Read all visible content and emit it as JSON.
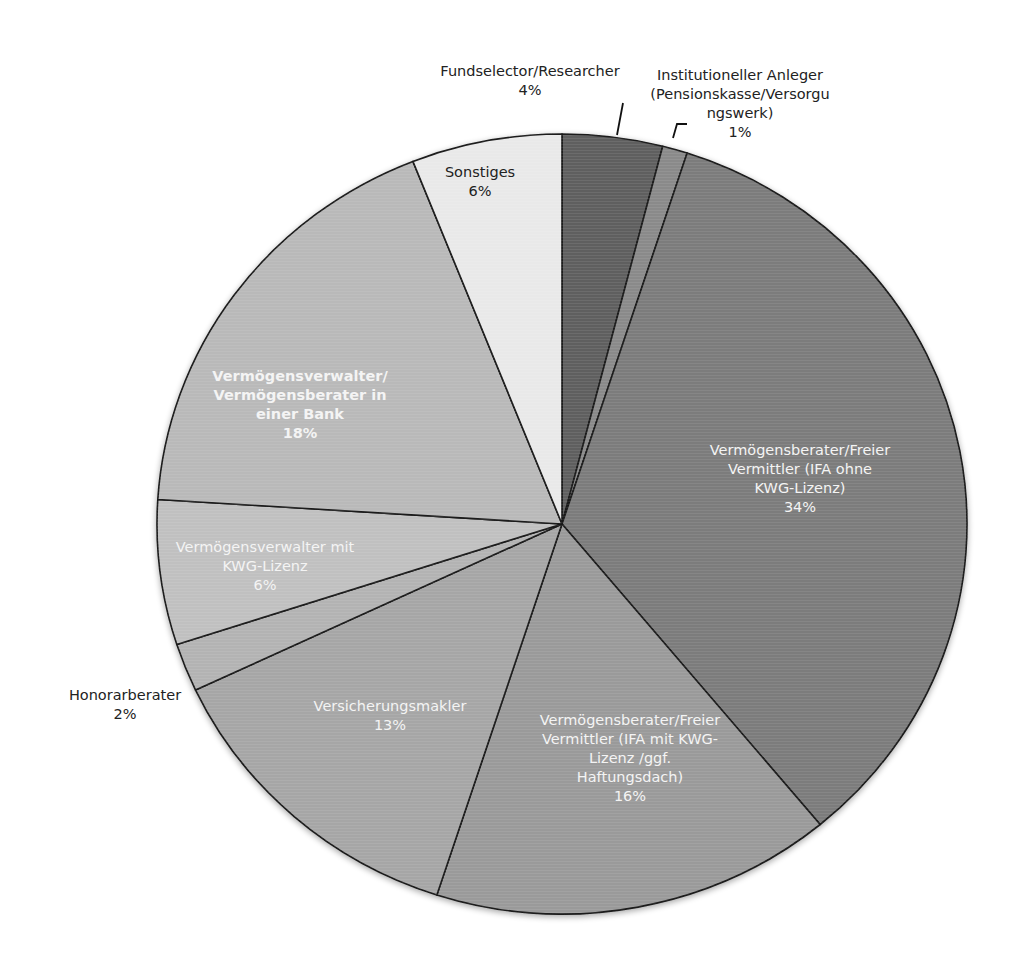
{
  "chart_data": {
    "type": "pie",
    "title": "",
    "start_angle": "12 o'clock, clockwise",
    "legend": "none (data labels on slices)",
    "slices": [
      {
        "label": "Fundselector/Researcher",
        "value": 4,
        "pct_label": "4%",
        "color": "#5e5e5e"
      },
      {
        "label": "Institutioneller Anleger (Pensionskasse/Versorgungswerk)",
        "value": 1,
        "pct_label": "1%",
        "color": "#8a8a8a"
      },
      {
        "label": "Vermögensberater/Freier Vermittler (IFA ohne KWG-Lizenz)",
        "value": 34,
        "pct_label": "34%",
        "color": "#7b7b7b"
      },
      {
        "label": "Vermögensberater/Freier Vermittler (IFA mit KWG-Lizenz /ggf. Haftungsdach)",
        "value": 16,
        "pct_label": "16%",
        "color": "#9a9a9a"
      },
      {
        "label": "Versicherungsmakler",
        "value": 13,
        "pct_label": "13%",
        "color": "#a6a6a6"
      },
      {
        "label": "Honorarberater",
        "value": 2,
        "pct_label": "2%",
        "color": "#b3b3b3"
      },
      {
        "label": "Vermögensverwalter mit KWG-Lizenz",
        "value": 6,
        "pct_label": "6%",
        "color": "#c0c0c0"
      },
      {
        "label": "Vermögensverwalter/ Vermögensberater in einer Bank",
        "value": 18,
        "pct_label": "18%",
        "color": "#b9b9b9"
      },
      {
        "label": "Sonstiges",
        "value": 6,
        "pct_label": "6%",
        "color": "#e9e9e9"
      }
    ]
  },
  "labels": {
    "fundselector": {
      "lines": [
        "Fundselector/Researcher"
      ],
      "pct": "4%"
    },
    "institutioneller": {
      "lines": [
        "Institutioneller Anleger",
        "(Pensionskasse/Versorgu",
        "ngswerk)"
      ],
      "pct": "1%"
    },
    "ifa_ohne": {
      "lines": [
        "Vermögensberater/Freier",
        "Vermittler (IFA ohne",
        "KWG-Lizenz)"
      ],
      "pct": "34%"
    },
    "ifa_mit": {
      "lines": [
        "Vermögensberater/Freier",
        "Vermittler (IFA mit KWG-",
        "Lizenz /ggf.",
        "Haftungsdach)"
      ],
      "pct": "16%"
    },
    "versicherungsmakler": {
      "lines": [
        "Versicherungsmakler"
      ],
      "pct": "13%"
    },
    "honorarberater": {
      "lines": [
        "Honorarberater"
      ],
      "pct": "2%"
    },
    "kwg": {
      "lines": [
        "Vermögensverwalter mit",
        "KWG-Lizenz"
      ],
      "pct": "6%"
    },
    "bank": {
      "lines": [
        "Vermögensverwalter/",
        "Vermögensberater in",
        "einer Bank"
      ],
      "pct": "18%"
    },
    "sonstiges": {
      "lines": [
        "Sonstiges"
      ],
      "pct": "6%"
    }
  },
  "text": {
    "fundselector": "Fundselector/Researcher",
    "fundselector_pct": "4%",
    "inst_1": "Institutioneller Anleger",
    "inst_2": "(Pensionskasse/Versorgu",
    "inst_3": "ngswerk)",
    "inst_pct": "1%",
    "ohne_1": "Vermögensberater/Freier",
    "ohne_2": "Vermittler (IFA ohne",
    "ohne_3": "KWG-Lizenz)",
    "ohne_pct": "34%",
    "mit_1": "Vermögensberater/Freier",
    "mit_2": "Vermittler (IFA mit KWG-",
    "mit_3": "Lizenz /ggf.",
    "mit_4": "Haftungsdach)",
    "mit_pct": "16%",
    "vm": "Versicherungsmakler",
    "vm_pct": "13%",
    "hb": "Honorarberater",
    "hb_pct": "2%",
    "kwg_1": "Vermögensverwalter mit",
    "kwg_2": "KWG-Lizenz",
    "kwg_pct": "6%",
    "bank_1": "Vermögensverwalter/",
    "bank_2": "Vermögensberater in",
    "bank_3": "einer Bank",
    "bank_pct": "18%",
    "sonst": "Sonstiges",
    "sonst_pct": "6%"
  }
}
